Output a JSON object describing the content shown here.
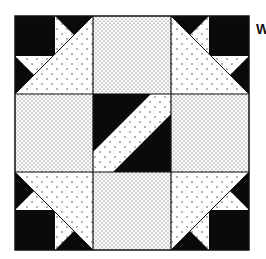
{
  "figure": {
    "grid": "3x3 nine-patch",
    "colors": {
      "dark": "#0a0a0a",
      "light": "#ffffff",
      "dots": "#333333",
      "border": "#111111"
    },
    "cells": [
      {
        "position": "top-left",
        "type": "corner-geese"
      },
      {
        "position": "top-center",
        "type": "dense-dotted-square"
      },
      {
        "position": "top-right",
        "type": "corner-geese"
      },
      {
        "position": "middle-left",
        "type": "dense-dotted-square"
      },
      {
        "position": "center",
        "type": "diagonal-band"
      },
      {
        "position": "middle-right",
        "type": "dense-dotted-square"
      },
      {
        "position": "bottom-left",
        "type": "corner-geese"
      },
      {
        "position": "bottom-center",
        "type": "dense-dotted-square"
      },
      {
        "position": "bottom-right",
        "type": "corner-geese"
      }
    ]
  },
  "margin_text": "W"
}
